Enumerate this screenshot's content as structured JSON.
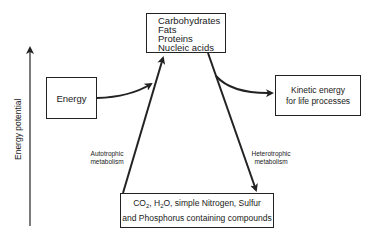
{
  "diagram": {
    "axis": {
      "label": "Energy potential",
      "direction": "up"
    },
    "nodes": {
      "top": {
        "items": [
          "Carbohydrates",
          "Fats",
          "Proteins",
          "Nucleic acids"
        ]
      },
      "energy": {
        "label": "Energy"
      },
      "kinetic": {
        "line1": "Kinetic energy",
        "line2": "for life processes"
      },
      "bottom": {
        "co2": "CO",
        "co2_sub": "2",
        "h2o_pre": ", H",
        "h2o_sub": "2",
        "h2o_post": "O, simple Nitrogen, Sulfur",
        "line2": "and Phosphorus containing compounds"
      }
    },
    "edges": {
      "autotrophic": {
        "line1": "Autotrophic",
        "line2": "metabolism",
        "from": "bottom",
        "to": "top"
      },
      "heterotrophic": {
        "line1": "Heterotrophic",
        "line2": "metabolism",
        "from": "top",
        "to": "bottom"
      },
      "energy_input": {
        "from": "energy",
        "to": "autotrophic"
      },
      "energy_output": {
        "from": "heterotrophic",
        "to": "kinetic"
      }
    },
    "colors": {
      "stroke": "#222222",
      "background": "#ffffff",
      "text": "#1a1a1a"
    }
  }
}
